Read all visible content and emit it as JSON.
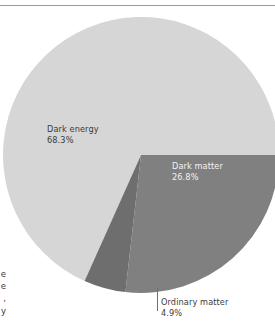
{
  "figure": {
    "background_color": "#ffffff",
    "rule_color": "#9a9a9a"
  },
  "chart_data": {
    "type": "pie",
    "title": "",
    "subtitle": "",
    "xlabel": "",
    "ylabel": "",
    "legend_position": "none",
    "grid": false,
    "labels_placement": "inside-slice-with-callout",
    "total": 100.0,
    "units": "%",
    "categories": [
      "Dark energy",
      "Dark matter",
      "Ordinary matter"
    ],
    "values": [
      68.3,
      26.8,
      4.9
    ],
    "colors": [
      "#d6d6d6",
      "#808080",
      "#6e6e6e"
    ],
    "start_angle_deg": 0,
    "direction": "clockwise",
    "slices": [
      {
        "name": "Dark energy",
        "value": 68.3,
        "value_label": "68.3%",
        "color": "#d6d6d6",
        "label_color": "#3c3c3c",
        "label_inside": true
      },
      {
        "name": "Dark matter",
        "value": 26.8,
        "value_label": "26.8%",
        "color": "#808080",
        "label_color": "#f2f2f2",
        "label_inside": true
      },
      {
        "name": "Ordinary matter",
        "value": 4.9,
        "value_label": "4.9%",
        "color": "#6e6e6e",
        "label_color": "#3c3c3c",
        "label_inside": false,
        "has_leader_line": true
      }
    ]
  },
  "caption_fragment": {
    "line1": "e",
    "line2": "e",
    "line3": ",",
    "line4": "y"
  }
}
